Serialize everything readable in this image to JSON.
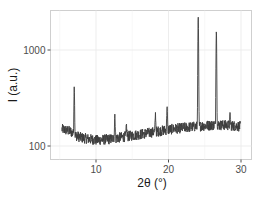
{
  "chart_data": {
    "type": "line",
    "title": "",
    "xlabel": "2θ (°)",
    "ylabel": "I (a.u.)",
    "x_scale": "linear",
    "y_scale": "log",
    "xlim": [
      4.5,
      31
    ],
    "ylim": [
      80,
      3000
    ],
    "x_ticks": [
      10,
      20,
      30
    ],
    "x_tick_labels": [
      "10",
      "20",
      "30"
    ],
    "y_ticks": [
      100,
      1000
    ],
    "y_tick_labels": [
      "100",
      "1000"
    ],
    "grid": true,
    "legend": "none",
    "line_color": "#3d3d3d",
    "series": [
      {
        "name": "XRD pattern",
        "x_range": [
          5.3,
          29.9
        ],
        "baseline": [
          [
            5.3,
            150
          ],
          [
            6.5,
            142
          ],
          [
            7.0,
            130
          ],
          [
            8.0,
            122
          ],
          [
            10.0,
            115
          ],
          [
            12.0,
            118
          ],
          [
            14.0,
            125
          ],
          [
            16.0,
            132
          ],
          [
            18.0,
            140
          ],
          [
            20.0,
            148
          ],
          [
            22.0,
            155
          ],
          [
            24.0,
            160
          ],
          [
            26.0,
            165
          ],
          [
            28.0,
            165
          ],
          [
            29.9,
            160
          ]
        ],
        "peaks": [
          {
            "x": 7.0,
            "y": 410
          },
          {
            "x": 12.6,
            "y": 215
          },
          {
            "x": 14.2,
            "y": 165
          },
          {
            "x": 18.2,
            "y": 215
          },
          {
            "x": 19.8,
            "y": 260
          },
          {
            "x": 24.1,
            "y": 2200
          },
          {
            "x": 26.6,
            "y": 1580
          },
          {
            "x": 28.5,
            "y": 215
          }
        ],
        "noise_amplitude_log10": 0.055
      }
    ]
  }
}
